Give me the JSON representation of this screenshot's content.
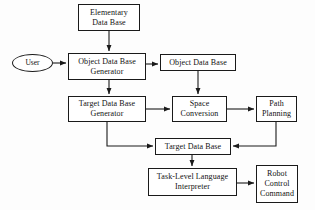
{
  "diagram": {
    "type": "flowchart",
    "canvas": {
      "width": 315,
      "height": 210
    },
    "stroke_color": "#1a1a1a",
    "fill_color": "#ffffff",
    "text_color": "#111111",
    "nodes": [
      {
        "id": "elementary-data-base",
        "label": "Elementary\nData Base",
        "shape": "rectangle",
        "x": 78,
        "y": 4,
        "w": 62,
        "h": 27
      },
      {
        "id": "user",
        "label": "User",
        "shape": "ellipse",
        "x": 12,
        "y": 54,
        "w": 41,
        "h": 18
      },
      {
        "id": "object-data-base-generator",
        "label": "Object Data Base\nGenerator",
        "shape": "rectangle",
        "x": 68,
        "y": 53,
        "w": 78,
        "h": 27
      },
      {
        "id": "object-data-base",
        "label": "Object Data Base",
        "shape": "rectangle",
        "x": 160,
        "y": 54,
        "w": 76,
        "h": 17
      },
      {
        "id": "target-data-base-generator",
        "label": "Target Data Base\nGenerator",
        "shape": "rectangle",
        "x": 68,
        "y": 96,
        "w": 78,
        "h": 26
      },
      {
        "id": "space-conversion",
        "label": "Space\nConversion",
        "shape": "rectangle",
        "x": 172,
        "y": 96,
        "w": 55,
        "h": 26
      },
      {
        "id": "path-planning",
        "label": "Path\nPlanning",
        "shape": "rectangle",
        "x": 256,
        "y": 96,
        "w": 41,
        "h": 26
      },
      {
        "id": "target-data-base",
        "label": "Target Data Base",
        "shape": "rectangle",
        "x": 155,
        "y": 138,
        "w": 76,
        "h": 17
      },
      {
        "id": "task-level-language-interpreter",
        "label": "Task-Level Language\nInterpreter",
        "shape": "rectangle",
        "x": 148,
        "y": 168,
        "w": 89,
        "h": 28
      },
      {
        "id": "robot-control-command",
        "label": "Robot\nControl\nCommand",
        "shape": "rectangle",
        "x": 256,
        "y": 165,
        "w": 42,
        "h": 38
      }
    ],
    "edges": [
      {
        "id": "edge-elementary-to-odbg",
        "from": "elementary-data-base",
        "to": "object-data-base-generator",
        "points": "109,31 109,51",
        "arrow": true
      },
      {
        "id": "edge-user-to-odbg",
        "from": "user",
        "to": "object-data-base-generator",
        "points": "53,63 66,63",
        "arrow": true
      },
      {
        "id": "edge-odbg-to-odb",
        "from": "object-data-base-generator",
        "to": "object-data-base",
        "points": "146,64 158,64",
        "arrow": true
      },
      {
        "id": "edge-odbg-to-tdbg",
        "from": "object-data-base-generator",
        "to": "target-data-base-generator",
        "points": "109,80 109,94",
        "arrow": true
      },
      {
        "id": "edge-odb-to-space",
        "from": "object-data-base",
        "to": "space-conversion",
        "points": "198,71 198,94",
        "arrow": true
      },
      {
        "id": "edge-tdbg-to-space",
        "from": "target-data-base-generator",
        "to": "space-conversion",
        "points": "146,109 170,109",
        "arrow": true
      },
      {
        "id": "edge-space-to-path",
        "from": "space-conversion",
        "to": "path-planning",
        "points": "227,109 254,109",
        "arrow": true
      },
      {
        "id": "edge-tdbg-to-tdb",
        "from": "target-data-base-generator",
        "to": "target-data-base",
        "points": "107,122 107,146 153,146",
        "arrow": true
      },
      {
        "id": "edge-path-to-tdb",
        "from": "path-planning",
        "to": "target-data-base",
        "points": "276,122 276,146 233,146",
        "arrow": true
      },
      {
        "id": "edge-tdb-to-interpreter",
        "from": "target-data-base",
        "to": "task-level-language-interpreter",
        "points": "192,155 192,166",
        "arrow": true
      },
      {
        "id": "edge-interpreter-to-robot",
        "from": "task-level-language-interpreter",
        "to": "robot-control-command",
        "points": "237,183 254,183",
        "arrow": true
      }
    ]
  }
}
